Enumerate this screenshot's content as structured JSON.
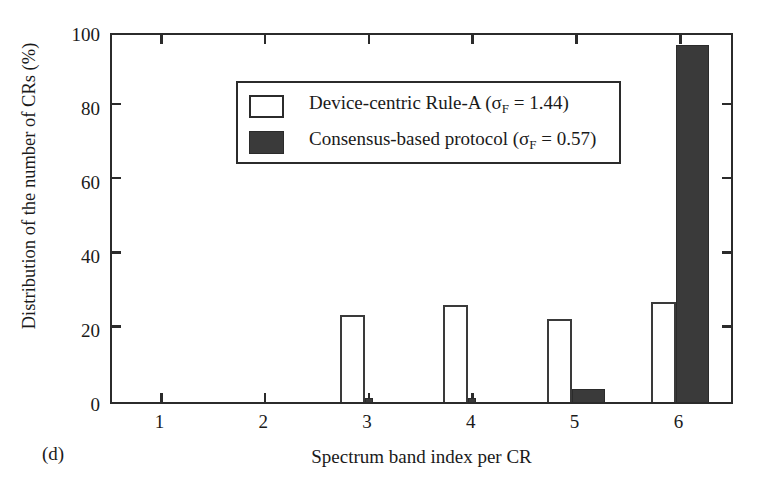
{
  "figure": {
    "panel_label": "(d)"
  },
  "chart_data": {
    "type": "bar",
    "title": "",
    "subtitle": "",
    "xlabel": "Spectrum band index per CR",
    "ylabel": "Distribution of the number of CRs (%)",
    "categories": [
      "1",
      "2",
      "3",
      "4",
      "5",
      "6"
    ],
    "xlim": [
      0.5,
      6.5
    ],
    "ylim": [
      0,
      100
    ],
    "yticks": [
      0,
      20,
      40,
      60,
      80,
      100
    ],
    "ytick_labels": [
      "0",
      "20",
      "40",
      "60",
      "80",
      "100"
    ],
    "xticks": [
      1,
      2,
      3,
      4,
      5,
      6
    ],
    "xtick_labels": [
      "1",
      "2",
      "3",
      "4",
      "5",
      "6"
    ],
    "grid": false,
    "legend_position": "upper-left-inside",
    "series": [
      {
        "name": "Device-centric Rule-A (σF = 1.44)",
        "style": "open",
        "color": "#ffffff",
        "edge_color": "#3a3a3a",
        "values": [
          0,
          0,
          23.5,
          26.2,
          22.5,
          27.0
        ]
      },
      {
        "name": "Consensus-based protocol (σF = 0.57)",
        "style": "filled",
        "color": "#3a3a3a",
        "edge_color": "#2b2b2b",
        "values": [
          0,
          0,
          1.2,
          1.0,
          3.4,
          96.2
        ]
      }
    ],
    "legend": [
      {
        "swatch": "open",
        "text_before": "Device-centric Rule-A (σ",
        "text_sub": "F",
        "text_after": " = 1.44)"
      },
      {
        "swatch": "filled",
        "text_before": "Consensus-based protocol (σ",
        "text_sub": "F",
        "text_after": " = 0.57)"
      }
    ]
  }
}
